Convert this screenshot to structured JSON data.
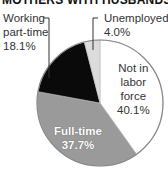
{
  "title": "MOTHERS WITH HUSBANDS",
  "labels": {
    "part_time": [
      "Working",
      "part-time",
      "18.1%"
    ],
    "unemployed": [
      "Unemployed",
      "4.0%"
    ],
    "not_in_labor_force": [
      "Not in",
      "labor",
      "force",
      "40.1%"
    ],
    "full_time": [
      "Full-time",
      "37.7%"
    ]
  },
  "colors": {
    "not_in_labor_force": "#ffffff",
    "full_time": "#9a9a9a",
    "part_time": "#0a0a0a",
    "unemployed": "#dcdcdc",
    "outline": "#888888"
  },
  "chart_data": {
    "type": "pie",
    "title": "MOTHERS WITH HUSBANDS",
    "categories": [
      "Not in labor force",
      "Full-time",
      "Working part-time",
      "Unemployed"
    ],
    "values": [
      40.1,
      37.7,
      18.1,
      4.0
    ],
    "unit": "%",
    "start_angle": "12 o'clock",
    "direction": "clockwise",
    "legend": "none (direct labels with leader lines)"
  }
}
